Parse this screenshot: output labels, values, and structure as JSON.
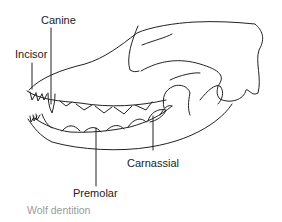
{
  "figure": {
    "caption": "Wolf dentition",
    "labels": [
      {
        "id": "canine",
        "text": "Canine"
      },
      {
        "id": "incisor",
        "text": "Incisor"
      },
      {
        "id": "premolar",
        "text": "Premolar"
      },
      {
        "id": "carnassial",
        "text": "Carnassial"
      }
    ],
    "colors": {
      "line": "#222222",
      "caption": "#9a9a9a",
      "background": "#ffffff"
    }
  }
}
